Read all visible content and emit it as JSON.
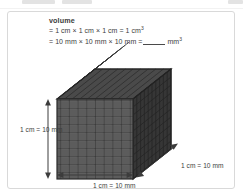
{
  "page": {
    "background_color": "#ffffff",
    "panel_border_color": "#d9d9d9"
  },
  "text_block": {
    "heading": "volume",
    "line1_prefix": "= 1 cm × 1 cm × 1 cm = 1 cm",
    "line1_exponent": "3",
    "line2_prefix": "= 10 mm × 10 mm × 10 mm =",
    "line2_suffix": "mm",
    "line2_exponent": "3",
    "blank_answer": ""
  },
  "diagram": {
    "type": "isometric-unit-cube",
    "units_per_edge": 10,
    "front_face_color": "#5c5c5c",
    "top_face_color": "#4a4a4a",
    "side_face_color": "#363636",
    "grid_line_color": "#2b2b2b",
    "arrow_color": "#3c3c3c",
    "height_label": "1 cm = 10 mm",
    "width_label": "1 cm = 10 mm",
    "depth_label": "1 cm = 10 mm"
  }
}
